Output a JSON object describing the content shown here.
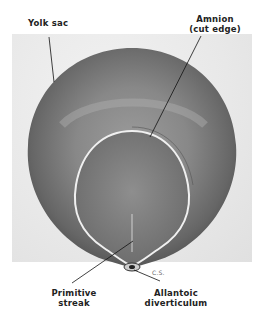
{
  "figure": {
    "labels": {
      "yolk_sac": "Yolk sac",
      "amnion_line1": "Amnion",
      "amnion_line2": "(cut edge)",
      "primitive_line1": "Primitive",
      "primitive_line2": "streak",
      "allantoic_line1": "Allantoic",
      "allantoic_line2": "diverticulum",
      "initials": "C.S."
    },
    "colors": {
      "background": "#ffffff",
      "photo_bg": "#e8e8e8",
      "yolk_sac_dark": "#555555",
      "yolk_sac_light": "#9a9a9a",
      "amnion_edge": "#f0f0f0",
      "leader_line": "#111111"
    }
  }
}
